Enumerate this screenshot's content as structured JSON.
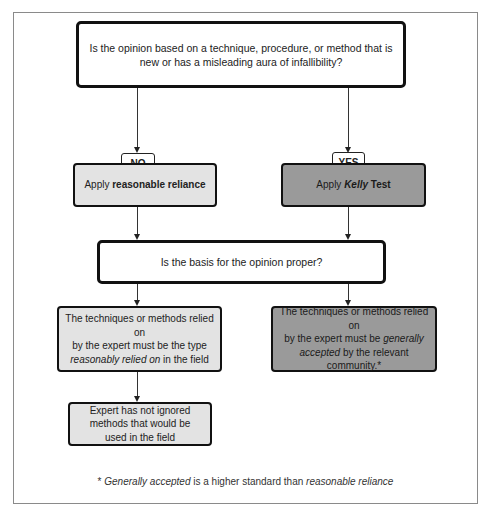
{
  "diagram": {
    "type": "flowchart",
    "question1": "Is the opinion based on a technique, procedure, or method that is new or has a misleading aura of infallibility?",
    "branch_no": "NO",
    "branch_yes": "YES",
    "apply_left": {
      "prefix": "Apply ",
      "bold": "reasonable reliance"
    },
    "apply_right": {
      "prefix": "Apply ",
      "bold_italic": "Kelly",
      "suffix": " Test"
    },
    "question2": "Is the basis for the opinion proper?",
    "left_requirement": {
      "line1": "The techniques or methods relied on",
      "line2": "by the expert must be the type",
      "italic": "reasonably relied on",
      "suffix": " in the field"
    },
    "right_requirement": {
      "line1": "The techniques or methods relied on",
      "line2_prefix": "by the expert must be ",
      "italic": "generally accepted",
      "suffix": " by the relevant community.*"
    },
    "left_followup": "Expert has not ignored methods that would be used in the field",
    "footnote": {
      "prefix": "* ",
      "italic1": "Generally accepted",
      "middle": " is a higher standard than ",
      "italic2": "reasonable reliance"
    },
    "colors": {
      "question_fill": "#ffffff",
      "light_fill": "#e3e3e3",
      "dark_fill": "#9a9a9a",
      "border": "#111111"
    }
  }
}
